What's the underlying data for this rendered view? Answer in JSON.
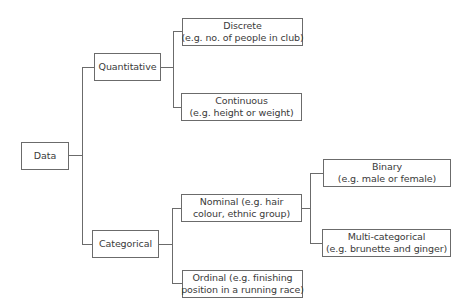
{
  "diagram": {
    "type": "tree",
    "root": {
      "label": "Data"
    },
    "level1": {
      "quantitative": {
        "label": "Quantitative"
      },
      "categorical": {
        "label": "Categorical"
      }
    },
    "level2": {
      "discrete": {
        "title": "Discrete",
        "example": "(e.g. no. of people in club)"
      },
      "continuous": {
        "title": "Continuous",
        "example": "(e.g. height or weight)"
      },
      "nominal": {
        "line1": "Nominal (e.g. hair",
        "line2": "colour, ethnic group)"
      },
      "ordinal": {
        "line1": "Ordinal (e.g. finishing",
        "line2": "position in a running race)"
      }
    },
    "level3": {
      "binary": {
        "title": "Binary",
        "example": "(e.g. male or female)"
      },
      "multicategorical": {
        "title": "Multi-categorical",
        "example": "(e.g. brunette and ginger)"
      }
    },
    "colors": {
      "line": "#6b6b6b",
      "text": "#3a3a3a",
      "background": "#ffffff"
    }
  }
}
